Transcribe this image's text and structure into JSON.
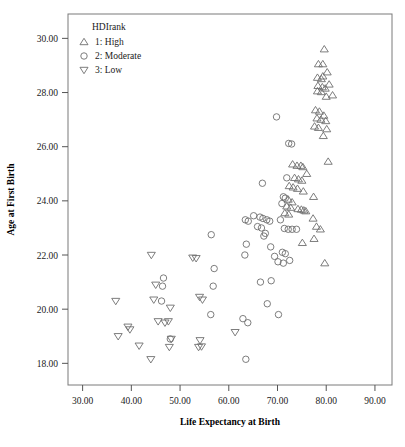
{
  "chart_data": {
    "type": "scatter",
    "title": "",
    "xlabel": "Life Expectancy at Birth",
    "ylabel": "Age at First Birth",
    "xlim": [
      27.0,
      93.5
    ],
    "ylim": [
      17.2,
      30.9
    ],
    "xticks": [
      30,
      40,
      50,
      60,
      70,
      80,
      90
    ],
    "xtick_labels": [
      "30.00",
      "40.00",
      "50.00",
      "60.00",
      "70.00",
      "80.00",
      "90.00"
    ],
    "yticks": [
      18,
      20,
      22,
      24,
      26,
      28,
      30
    ],
    "ytick_labels": [
      "18.00",
      "20.00",
      "22.00",
      "24.00",
      "26.00",
      "28.00",
      "30.00"
    ],
    "grid": false,
    "legend_position": "top-left-inside",
    "legend_title": "HDIrank",
    "marker_color": "#6e6e6e",
    "series": [
      {
        "name": "1: High",
        "marker": "triangle-up",
        "points": [
          [
            79.6,
            29.6
          ],
          [
            78.4,
            29.05
          ],
          [
            79.3,
            29.05
          ],
          [
            80.2,
            28.75
          ],
          [
            79.3,
            28.6
          ],
          [
            78.2,
            28.55
          ],
          [
            79.0,
            28.5
          ],
          [
            80.6,
            28.3
          ],
          [
            78.3,
            28.25
          ],
          [
            79.2,
            28.2
          ],
          [
            79.8,
            28.15
          ],
          [
            78.2,
            28.05
          ],
          [
            79.0,
            28.02
          ],
          [
            80.0,
            27.85
          ],
          [
            81.3,
            27.9
          ],
          [
            77.8,
            27.35
          ],
          [
            78.6,
            27.3
          ],
          [
            79.5,
            27.15
          ],
          [
            78.1,
            27.05
          ],
          [
            78.9,
            27.0
          ],
          [
            79.9,
            26.95
          ],
          [
            77.6,
            26.75
          ],
          [
            78.4,
            26.7
          ],
          [
            80.1,
            26.65
          ],
          [
            79.4,
            26.4
          ],
          [
            80.4,
            25.45
          ],
          [
            73.1,
            25.35
          ],
          [
            74.0,
            25.3
          ],
          [
            74.8,
            25.3
          ],
          [
            75.2,
            25.25
          ],
          [
            76.0,
            25.0
          ],
          [
            73.5,
            24.85
          ],
          [
            74.3,
            24.8
          ],
          [
            75.0,
            24.75
          ],
          [
            72.4,
            24.55
          ],
          [
            73.2,
            24.5
          ],
          [
            74.1,
            24.45
          ],
          [
            75.3,
            24.35
          ],
          [
            77.4,
            24.15
          ],
          [
            72.2,
            24.05
          ],
          [
            73.0,
            23.95
          ],
          [
            71.9,
            23.8
          ],
          [
            72.7,
            23.75
          ],
          [
            74.2,
            23.7
          ],
          [
            74.9,
            23.68
          ],
          [
            75.4,
            23.65
          ],
          [
            75.8,
            23.62
          ],
          [
            71.5,
            23.55
          ],
          [
            72.3,
            23.5
          ],
          [
            77.3,
            23.35
          ],
          [
            78.0,
            23.05
          ],
          [
            78.8,
            22.95
          ],
          [
            77.5,
            22.6
          ],
          [
            75.1,
            22.45
          ],
          [
            79.7,
            21.7
          ]
        ]
      },
      {
        "name": "2: Moderate",
        "marker": "circle",
        "points": [
          [
            69.8,
            27.1
          ],
          [
            72.3,
            26.12
          ],
          [
            72.9,
            26.1
          ],
          [
            66.9,
            24.65
          ],
          [
            71.9,
            24.85
          ],
          [
            71.2,
            24.15
          ],
          [
            71.6,
            24.1
          ],
          [
            70.9,
            23.9
          ],
          [
            63.4,
            23.3
          ],
          [
            64.0,
            23.25
          ],
          [
            65.1,
            23.45
          ],
          [
            66.4,
            23.4
          ],
          [
            67.0,
            23.35
          ],
          [
            67.8,
            23.3
          ],
          [
            68.4,
            23.25
          ],
          [
            70.6,
            23.3
          ],
          [
            65.9,
            23.05
          ],
          [
            66.7,
            23.0
          ],
          [
            71.4,
            22.98
          ],
          [
            72.2,
            22.95
          ],
          [
            73.0,
            22.95
          ],
          [
            73.9,
            22.95
          ],
          [
            67.5,
            22.8
          ],
          [
            67.2,
            22.7
          ],
          [
            56.4,
            22.75
          ],
          [
            63.6,
            22.4
          ],
          [
            68.6,
            22.3
          ],
          [
            71.0,
            22.1
          ],
          [
            71.6,
            22.05
          ],
          [
            63.3,
            22.0
          ],
          [
            69.4,
            21.95
          ],
          [
            70.1,
            21.75
          ],
          [
            71.2,
            21.7
          ],
          [
            72.5,
            21.8
          ],
          [
            57.0,
            21.5
          ],
          [
            66.5,
            21.0
          ],
          [
            68.7,
            21.05
          ],
          [
            56.8,
            20.85
          ],
          [
            46.6,
            21.15
          ],
          [
            46.4,
            20.85
          ],
          [
            67.9,
            20.2
          ],
          [
            46.2,
            20.3
          ],
          [
            56.3,
            19.8
          ],
          [
            70.2,
            19.8
          ],
          [
            62.9,
            19.65
          ],
          [
            63.9,
            19.5
          ],
          [
            63.5,
            18.15
          ],
          [
            48.0,
            18.9
          ]
        ]
      },
      {
        "name": "3: Low",
        "marker": "triangle-down",
        "points": [
          [
            44.1,
            22.0
          ],
          [
            52.6,
            21.9
          ],
          [
            53.3,
            21.88
          ],
          [
            45.0,
            20.9
          ],
          [
            36.8,
            20.3
          ],
          [
            44.6,
            20.35
          ],
          [
            54.0,
            20.45
          ],
          [
            54.6,
            20.35
          ],
          [
            48.0,
            20.05
          ],
          [
            45.5,
            19.55
          ],
          [
            46.9,
            19.5
          ],
          [
            47.6,
            19.55
          ],
          [
            39.3,
            19.35
          ],
          [
            39.7,
            19.25
          ],
          [
            37.3,
            19.0
          ],
          [
            61.3,
            19.15
          ],
          [
            48.2,
            18.9
          ],
          [
            54.1,
            18.85
          ],
          [
            41.6,
            18.65
          ],
          [
            47.8,
            18.6
          ],
          [
            53.8,
            18.6
          ],
          [
            54.4,
            18.62
          ],
          [
            44.0,
            18.15
          ]
        ]
      }
    ]
  },
  "legend": {
    "title": "HDIrank",
    "entries": [
      {
        "label": "1: High",
        "marker": "triangle-up"
      },
      {
        "label": "2: Moderate",
        "marker": "circle"
      },
      {
        "label": "3: Low",
        "marker": "triangle-down"
      }
    ]
  }
}
